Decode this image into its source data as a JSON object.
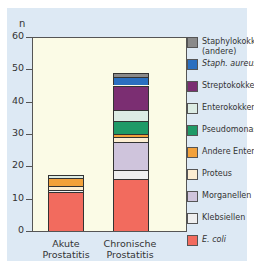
{
  "chart_data": {
    "type": "bar",
    "stacked": true,
    "title": "",
    "xlabel": "",
    "ylabel": "n",
    "ylim": [
      0,
      60
    ],
    "yticks": [
      0,
      10,
      20,
      30,
      40,
      50,
      60
    ],
    "categories": [
      "Akute Prostatitis",
      "Chronische Prostatitis"
    ],
    "series": [
      {
        "name": "E. coli",
        "italic": true,
        "color": "#f26b5e",
        "values": [
          12,
          16
        ]
      },
      {
        "name": "Klebsiellen",
        "color": "#efefef",
        "values": [
          0.8,
          3
        ]
      },
      {
        "name": "Morganellen",
        "color": "#cfc4dc",
        "values": [
          0,
          8.5
        ]
      },
      {
        "name": "Proteus",
        "color": "#fdeed2",
        "values": [
          1,
          1.5
        ]
      },
      {
        "name": "Andere Enterobakt.",
        "color": "#f2a13b",
        "values": [
          2.5,
          1
        ]
      },
      {
        "name": "Pseudomonas",
        "color": "#1f9a67",
        "values": [
          0,
          4
        ]
      },
      {
        "name": "Enterokokken",
        "color": "#dcece4",
        "values": [
          1,
          3.5
        ]
      },
      {
        "name": "Streptokokken",
        "color": "#7b2e72",
        "values": [
          0,
          7.5
        ]
      },
      {
        "name": "Staph. aureus",
        "italic": true,
        "color": "#2a6fc0",
        "values": [
          0,
          2.5
        ]
      },
      {
        "name": "Staphylokokken (andere)",
        "color": "#8a8a8a",
        "values": [
          0,
          1.5
        ]
      }
    ],
    "totals": [
      17.3,
      49
    ],
    "legend_position": "right",
    "grid": false
  },
  "labels": {
    "axis_n": "n",
    "ticks": [
      "60",
      "50",
      "40",
      "30",
      "20",
      "10",
      "0"
    ],
    "cat1_line1": "Akute",
    "cat1_line2": "Prostatitis",
    "cat2_line1": "Chronische",
    "cat2_line2": "Prostatitis"
  },
  "legend": [
    {
      "line1": "Staphylokokken",
      "line2": "(andere)",
      "color": "#8a8a8a",
      "italic": false
    },
    {
      "line1": "Staph. aureus",
      "color": "#2a6fc0",
      "italic": true
    },
    {
      "line1": "Streptokokken",
      "color": "#7b2e72",
      "italic": false
    },
    {
      "line1": "Enterokokken",
      "color": "#dcece4",
      "italic": false
    },
    {
      "line1": "Pseudomonas",
      "color": "#1f9a67",
      "italic": false
    },
    {
      "line1": "Andere Enterobakt.",
      "color": "#f2a13b",
      "italic": false
    },
    {
      "line1": "Proteus",
      "color": "#fdeed2",
      "italic": false
    },
    {
      "line1": "Morganellen",
      "color": "#cfc4dc",
      "italic": false
    },
    {
      "line1": "Klebsiellen",
      "color": "#efefef",
      "italic": false
    },
    {
      "line1": "E. coli",
      "color": "#f26b5e",
      "italic": true
    }
  ]
}
